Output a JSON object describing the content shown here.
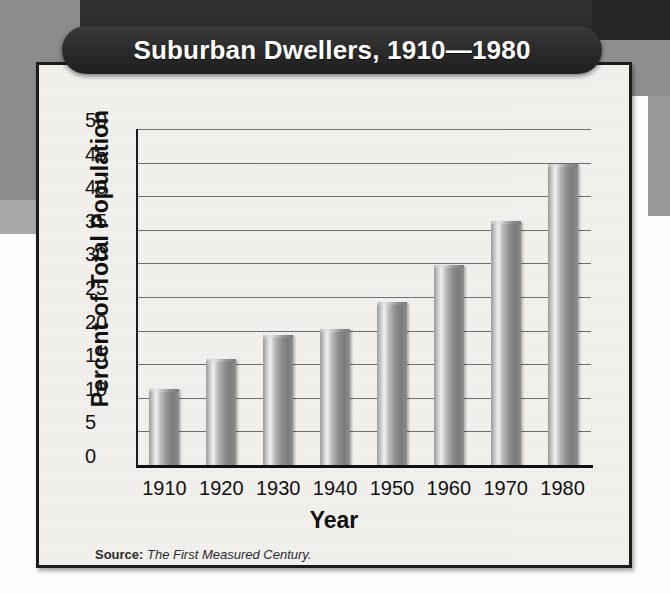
{
  "figure": {
    "title": "Suburban Dwellers, 1910—1980",
    "source_label": "Source:",
    "source_title": "The First Measured Century.",
    "colors": {
      "banner_dark": "#2b2b2b",
      "banner_text": "#ffffff",
      "card_background": "#f2f1ee",
      "card_border": "#1c1c1c",
      "gridline": "#6e6e6e",
      "axis": "#111111",
      "bar_light": "#f0f0f0",
      "bar_mid": "#9a9a9a",
      "bar_dark": "#7b7b7b",
      "page_gray": "#8c8c8c",
      "page_dark": "#2a2a2a"
    }
  },
  "chart_data": {
    "type": "bar",
    "title": "Suburban Dwellers, 1910—1980",
    "xlabel": "Year",
    "ylabel": "Percent of Total Population",
    "categories": [
      "1910",
      "1920",
      "1930",
      "1940",
      "1950",
      "1960",
      "1970",
      "1980"
    ],
    "values": [
      11,
      15.5,
      19,
      20,
      24,
      29.5,
      36,
      44.5
    ],
    "ylim": [
      0,
      50
    ],
    "yticks": [
      0,
      5,
      10,
      15,
      20,
      25,
      30,
      35,
      40,
      45,
      50
    ],
    "ytick_labels": [
      "0",
      "5",
      "10",
      "15",
      "20",
      "25",
      "30",
      "35",
      "40",
      "45",
      "50"
    ],
    "grid": true,
    "legend": null,
    "source": "Source: The First Measured Century."
  }
}
